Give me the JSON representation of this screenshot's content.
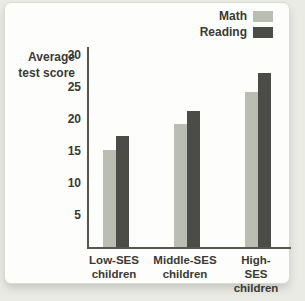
{
  "window": {
    "outer_background": "#eaebe5",
    "card_background": "#fdfdfb",
    "text_color": "#3a3a34",
    "axis_color": "#55554e"
  },
  "chart_data": {
    "type": "bar",
    "title": "",
    "ylabel": "Average\ntest score",
    "xlabel": "",
    "categories": [
      "Low-SES\nchildren",
      "Middle-SES\nchildren",
      "High-SES\nchildren"
    ],
    "series": [
      {
        "name": "Math",
        "color": "#b9bdb2",
        "values": [
          15.2,
          19.2,
          24.2
        ]
      },
      {
        "name": "Reading",
        "color": "#4b4c47",
        "values": [
          17.4,
          21.3,
          27.2
        ]
      }
    ],
    "yticks": [
      5,
      10,
      15,
      20,
      25,
      30
    ],
    "ylim": [
      0,
      31.25
    ],
    "grid": false,
    "legend_position": "top-right"
  }
}
